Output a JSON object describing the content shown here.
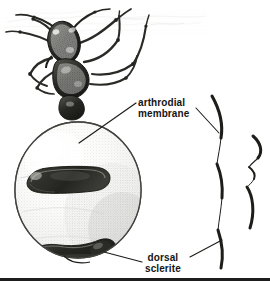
{
  "figure": {
    "type": "scientific-line-illustration",
    "background_color": "#ffffff",
    "ink_color": "#1d1d1d",
    "width_px": 270,
    "height_px": 281
  },
  "labels": {
    "arthrodial_membrane": {
      "line1": "arthrodial",
      "line2": "membrane"
    },
    "dorsal_sclerite": {
      "line1": "dorsal",
      "line2": "sclerite"
    }
  },
  "annotations": {
    "bracket_outer_name": "outer-bracket",
    "bracket_inner_name": "inner-bracket",
    "leader_membrane_name": "leader-line-arthrodial-membrane",
    "leader_sclerite_name": "leader-line-dorsal-sclerite"
  },
  "anatomy_parts": [
    {
      "name": "head",
      "shade": "dark"
    },
    {
      "name": "antennae",
      "shade": "dark"
    },
    {
      "name": "mesosoma-thorax",
      "shade": "dark"
    },
    {
      "name": "legs",
      "shade": "medium"
    },
    {
      "name": "petiole",
      "shade": "dark"
    },
    {
      "name": "gaster-distended",
      "shade": "light"
    },
    {
      "name": "dorsal-sclerite-upper-band",
      "shade": "dark"
    },
    {
      "name": "dorsal-sclerite-lower-band",
      "shade": "dark"
    },
    {
      "name": "arthrodial-membrane-surface",
      "shade": "light"
    },
    {
      "name": "substrate-texture",
      "shade": "faint"
    }
  ],
  "colors": {
    "ink": "#1d1d1d",
    "mid_tone": "#6b6b6b",
    "light_tone": "#d8d8d4",
    "pale_tone": "#eeeeec",
    "faint_tone": "#c9c9c6",
    "background": "#ffffff",
    "text": "#141414"
  }
}
